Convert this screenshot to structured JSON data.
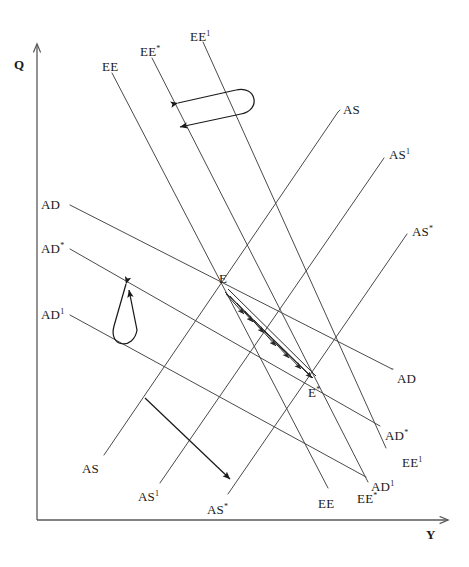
{
  "figure": {
    "type": "economics-line-diagram",
    "title": "",
    "background_color": "#ffffff",
    "line_color": "#4a4a4a",
    "axis_color": "#595959",
    "arrow_color": "#1a1a1a",
    "width": 469,
    "height": 567
  },
  "axes": {
    "y_axis": {
      "label": "Q",
      "label_x": 14,
      "label_y": 58
    },
    "x_axis": {
      "label": "Y",
      "label_x": 426,
      "label_y": 528
    },
    "origin": {
      "x": 37,
      "y": 520
    }
  },
  "labels": [
    {
      "name": "ee-top",
      "text": "EE",
      "prime": "",
      "x": 102,
      "y": 60
    },
    {
      "name": "ee-star-top",
      "text": "EE",
      "prime": "*",
      "x": 140,
      "y": 45
    },
    {
      "name": "ee-prime-top",
      "text": "EE",
      "prime": "1",
      "x": 190,
      "y": 30
    },
    {
      "name": "as-top",
      "text": "AS",
      "prime": "",
      "x": 343,
      "y": 103
    },
    {
      "name": "as-prime-top",
      "text": "AS",
      "prime": "1",
      "x": 389,
      "y": 148
    },
    {
      "name": "as-star-top",
      "text": "AS",
      "prime": "*",
      "x": 412,
      "y": 225
    },
    {
      "name": "ad-left",
      "text": "AD",
      "prime": "",
      "x": 41,
      "y": 198
    },
    {
      "name": "ad-star-left",
      "text": "AD",
      "prime": "*",
      "x": 41,
      "y": 242
    },
    {
      "name": "ad-prime-left",
      "text": "AD",
      "prime": "1",
      "x": 41,
      "y": 308
    },
    {
      "name": "point-e",
      "text": "E",
      "prime": "",
      "x": 219,
      "y": 272
    },
    {
      "name": "point-e-star",
      "text": "E",
      "prime": "*",
      "x": 308,
      "y": 386
    },
    {
      "name": "ad-right",
      "text": "AD",
      "prime": "",
      "x": 397,
      "y": 372
    },
    {
      "name": "ad-star-right",
      "text": "AD",
      "prime": "*",
      "x": 385,
      "y": 429
    },
    {
      "name": "ee-prime-bot-right",
      "text": "EE",
      "prime": "1",
      "x": 402,
      "y": 456
    },
    {
      "name": "ad-prime-right",
      "text": "AD",
      "prime": "1",
      "x": 371,
      "y": 480
    },
    {
      "name": "as-bottom",
      "text": "AS",
      "prime": "",
      "x": 82,
      "y": 462
    },
    {
      "name": "as-prime-bot",
      "text": "AS",
      "prime": "1",
      "x": 138,
      "y": 490
    },
    {
      "name": "as-star-bot",
      "text": "AS",
      "prime": "*",
      "x": 207,
      "y": 503
    },
    {
      "name": "ee-bottom",
      "text": "EE",
      "prime": "",
      "x": 318,
      "y": 497
    },
    {
      "name": "ee-star-bot",
      "text": "EE",
      "prime": "*",
      "x": 357,
      "y": 492
    }
  ],
  "curves": {
    "ee_family": [
      {
        "name": "EE",
        "x1": 112,
        "y1": 73,
        "x2": 328,
        "y2": 488
      },
      {
        "name": "EE*",
        "x1": 152,
        "y1": 58,
        "x2": 368,
        "y2": 482
      },
      {
        "name": "EE1",
        "x1": 203,
        "y1": 42,
        "x2": 386,
        "y2": 448
      }
    ],
    "ad_family": [
      {
        "name": "AD",
        "x1": 70,
        "y1": 205,
        "x2": 392,
        "y2": 369
      },
      {
        "name": "AD*",
        "x1": 70,
        "y1": 249,
        "x2": 380,
        "y2": 426
      },
      {
        "name": "AD1",
        "x1": 70,
        "y1": 315,
        "x2": 366,
        "y2": 477
      }
    ],
    "as_family": [
      {
        "name": "AS",
        "x1": 104,
        "y1": 455,
        "x2": 338,
        "y2": 112
      },
      {
        "name": "AS1",
        "x1": 160,
        "y1": 483,
        "x2": 384,
        "y2": 158
      },
      {
        "name": "AS*",
        "x1": 228,
        "y1": 494,
        "x2": 407,
        "y2": 234
      }
    ]
  },
  "equilibria": [
    {
      "name": "E",
      "x": 224,
      "y": 292
    },
    {
      "name": "E*",
      "x": 313,
      "y": 378
    }
  ],
  "shift_arrows": [
    {
      "name": "ee-shift-loop",
      "description": "double-headed U-loop arrow between EE* and EE1 near the top",
      "left_tip": {
        "x": 173,
        "y": 105
      },
      "right_tip": {
        "x": 231,
        "y": 116
      }
    },
    {
      "name": "ad-shift-loop",
      "description": "double-headed U-loop arrow between AD* and AD1 on the left",
      "upper_tip": {
        "x": 122,
        "y": 278
      },
      "lower_tip": {
        "x": 124,
        "y": 332
      }
    },
    {
      "name": "as-shift-arrow",
      "description": "single arrow pointing down-right toward AS*",
      "from": {
        "x": 145,
        "y": 398
      },
      "to": {
        "x": 234,
        "y": 483
      }
    }
  ],
  "adjustment_path": {
    "name": "cobweb-path",
    "description": "zigzag cobweb adjustment arrows from E down to E*",
    "from": "E",
    "to": "E*",
    "segment_count": 6
  }
}
